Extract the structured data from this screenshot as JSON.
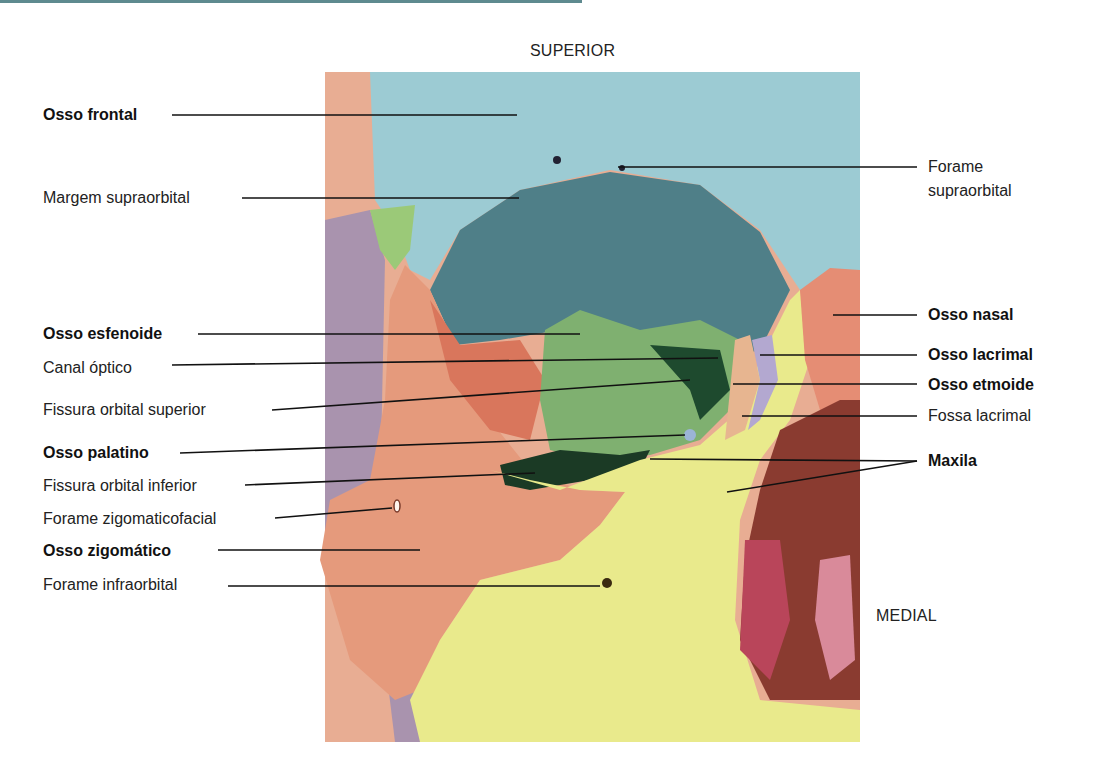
{
  "figure": {
    "orientation": {
      "top": "SUPERIOR",
      "right": "MEDIAL"
    },
    "labels_left": [
      {
        "id": "osso-frontal",
        "text": "Osso frontal",
        "bold": true
      },
      {
        "id": "margem-supraorbital",
        "text": "Margem supraorbital",
        "bold": false
      },
      {
        "id": "osso-esfenoide",
        "text": "Osso esfenoide",
        "bold": true
      },
      {
        "id": "canal-optico",
        "text": "Canal óptico",
        "bold": false
      },
      {
        "id": "fissura-orbital-superior",
        "text": "Fissura orbital superior",
        "bold": false
      },
      {
        "id": "osso-palatino",
        "text": "Osso palatino",
        "bold": true
      },
      {
        "id": "fissura-orbital-inferior",
        "text": "Fissura orbital inferior",
        "bold": false
      },
      {
        "id": "forame-zigomaticofacial",
        "text": "Forame zigomaticofacial",
        "bold": false
      },
      {
        "id": "osso-zigomatico",
        "text": "Osso zigomático",
        "bold": true
      },
      {
        "id": "forame-infraorbital",
        "text": "Forame infraorbital",
        "bold": false
      }
    ],
    "labels_right": [
      {
        "id": "forame-supraorbital",
        "text_line1": "Forame",
        "text_line2": "supraorbital",
        "bold": false
      },
      {
        "id": "osso-nasal",
        "text": "Osso nasal",
        "bold": true
      },
      {
        "id": "osso-lacrimal",
        "text": "Osso lacrimal",
        "bold": true
      },
      {
        "id": "osso-etmoide",
        "text": "Osso etmoide",
        "bold": true
      },
      {
        "id": "fossa-lacrimal",
        "text": "Fossa lacrimal",
        "bold": false
      },
      {
        "id": "maxila",
        "text": "Maxila",
        "bold": true
      }
    ],
    "colors": {
      "frontal": "#9ccbd3",
      "orbit": "#4f7f88",
      "zygomatic": "#e59a7c",
      "sphenoid": "#7fb070",
      "maxilla": "#e9ea8c",
      "nasal": "#e58d74",
      "lacrimal": "#b3a8d0",
      "ethmoid": "#e7b590",
      "palatine": "#9bb4d6",
      "temporal": "#e8ad93",
      "purple": "#a993ae",
      "cavity": "#8a3b30"
    }
  }
}
